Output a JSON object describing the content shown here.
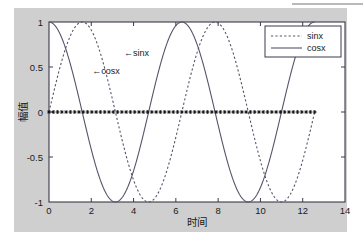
{
  "figure": {
    "background_color": "#cfcfcf",
    "plot_background_color": "#ffffff",
    "axis_color": "#3a3a4a",
    "curve_color": "#55556a",
    "marker_color": "#111111",
    "page_background_color": "#ffffff"
  },
  "chart_data": {
    "type": "line",
    "title": "",
    "xlabel": "时间",
    "ylabel": "幅值",
    "xlim": [
      0,
      14
    ],
    "ylim": [
      -1,
      1
    ],
    "xticks": [
      0,
      2,
      4,
      6,
      8,
      10,
      12,
      14
    ],
    "xtick_labels": [
      "0",
      "2",
      "4",
      "6",
      "8",
      "10",
      "12",
      "14"
    ],
    "yticks": [
      -1,
      -0.5,
      0,
      0.5,
      1
    ],
    "ytick_labels": [
      "-1",
      "-0.5",
      "0",
      "0.5",
      "1"
    ],
    "grid": false,
    "x_data_start": 0,
    "x_data_end": 12.566,
    "series": [
      {
        "name": "sinx",
        "function": "sin",
        "linestyle": "dotted",
        "color": "#55556a",
        "linewidth": 1.1,
        "legend_label": "sinx"
      },
      {
        "name": "cosx",
        "function": "cos",
        "linestyle": "solid",
        "color": "#55556a",
        "linewidth": 1.1,
        "legend_label": "cosx"
      },
      {
        "name": "zero-markers",
        "function": "zero",
        "linestyle": "markers",
        "marker": "star",
        "color": "#111111",
        "marker_count": 63,
        "legend_label": ""
      }
    ],
    "annotations": [
      {
        "text": "←sinx",
        "x_data": 3.55,
        "y_data": 0.62
      },
      {
        "text": "←cosx",
        "x_data": 2.05,
        "y_data": 0.42
      }
    ],
    "legend": {
      "position": "upper right",
      "entries": [
        {
          "label": "sinx",
          "linestyle": "dotted"
        },
        {
          "label": "cosx",
          "linestyle": "solid"
        }
      ]
    }
  }
}
